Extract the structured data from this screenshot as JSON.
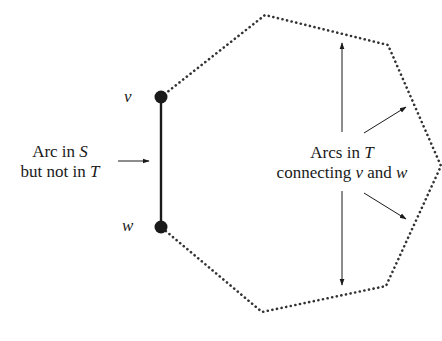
{
  "diagram": {
    "type": "graph-cycle-illustration",
    "nodes": [
      {
        "id": "v",
        "label": "v",
        "x": 161,
        "y": 97
      },
      {
        "id": "w",
        "label": "w",
        "x": 161,
        "y": 227
      }
    ],
    "solid_arc": {
      "from": "v",
      "to": "w",
      "meaning": "Arc in S but not in T"
    },
    "dotted_path_vertices": [
      [
        161,
        97
      ],
      [
        265,
        15
      ],
      [
        388,
        45
      ],
      [
        441,
        166
      ],
      [
        386,
        286
      ],
      [
        262,
        312
      ],
      [
        161,
        227
      ]
    ],
    "colors": {
      "ink": "#1a1a1a",
      "dotted": "#333333",
      "background": "#ffffff"
    }
  },
  "labels": {
    "v": "v",
    "w": "w",
    "left_line1_prefix": "Arc in ",
    "left_line1_var": "S",
    "left_line2_prefix": "but not in ",
    "left_line2_var": "T",
    "right_line1_prefix": "Arcs in ",
    "right_line1_var": "T",
    "right_line2_prefix": "connecting ",
    "right_line2_var1": "v",
    "right_line2_mid": " and ",
    "right_line2_var2": "w"
  }
}
